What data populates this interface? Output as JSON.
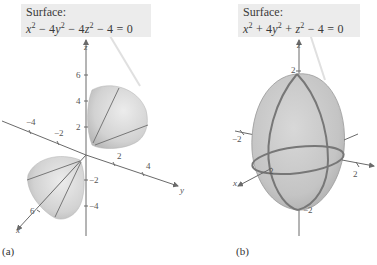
{
  "figures": [
    {
      "label": "(a)",
      "surface_title": "Surface:",
      "equation": {
        "t1": "x",
        "e1": "2",
        "op1": " − 4",
        "t2": "y",
        "e2": "2",
        "op2": " − 4",
        "t3": "z",
        "e3": "2",
        "tail": " − 4 = 0"
      },
      "shape": "hyperboloid of two sheets",
      "axes": {
        "x": {
          "label": "x",
          "ticks": [
            "6"
          ]
        },
        "y": {
          "label": "y",
          "ticks": [
            "2",
            "4",
            "−2",
            "−4"
          ]
        },
        "z": {
          "label": "z",
          "ticks": [
            "6",
            "4",
            "2",
            "−2",
            "−4"
          ]
        }
      },
      "tick_labels": {
        "z6": "6",
        "z4": "4",
        "z2": "2",
        "zm2": "−2",
        "zm4": "−4",
        "ym4": "−4",
        "ym2": "−2",
        "y2": "2",
        "y4": "4",
        "x6": "6"
      }
    },
    {
      "label": "(b)",
      "surface_title": "Surface:",
      "equation": {
        "t1": "x",
        "e1": "2",
        "op1": " + 4",
        "t2": "y",
        "e2": "2",
        "op2": " + ",
        "t3": "z",
        "e3": "2",
        "tail": " − 4 = 0"
      },
      "shape": "ellipsoid",
      "axes": {
        "x": {
          "label": "x",
          "ticks": [
            "2"
          ]
        },
        "y": {
          "label": "y",
          "ticks": [
            "2",
            "−2"
          ]
        },
        "z": {
          "label": "z",
          "ticks": [
            "2",
            "−2"
          ]
        }
      },
      "tick_labels": {
        "z2": "2",
        "zm2": "−2",
        "ym2": "−2",
        "y2": "2",
        "x2": "2"
      }
    }
  ],
  "colors": {
    "surface": "#c9c9c9",
    "surface_dark": "#a9a9a9",
    "axis": "#6a6a6a",
    "trace": "#7a7a7a",
    "box": "#ececec"
  }
}
